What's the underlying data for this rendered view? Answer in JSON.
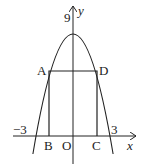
{
  "figure": {
    "labels": {
      "y_axis": "y",
      "x_axis": "x",
      "vertex_value": "9",
      "neg_intercept": "−3",
      "pos_intercept": "3",
      "origin": "O",
      "A": "A",
      "B": "B",
      "C": "C",
      "D": "D"
    },
    "colors": {
      "stroke": "#222222",
      "background": "#ffffff"
    }
  }
}
